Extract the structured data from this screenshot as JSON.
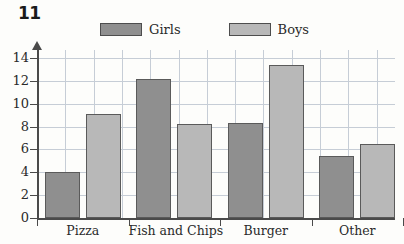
{
  "question_number": "11",
  "legend": {
    "position": "top-center",
    "entries": [
      {
        "label": "Girls",
        "color": "#8f8f8f",
        "swatch_name": "legend-swatch-girls"
      },
      {
        "label": "Boys",
        "color": "#b8b8b8",
        "swatch_name": "legend-swatch-boys"
      }
    ]
  },
  "axes": {
    "y_ticks": [
      "0",
      "2",
      "4",
      "6",
      "8",
      "10",
      "12",
      "14"
    ],
    "y_arrow": true,
    "grid": true
  },
  "chart_data": {
    "type": "bar",
    "title": "11",
    "xlabel": "",
    "ylabel": "",
    "ylim": [
      0,
      14.6
    ],
    "y_ticks": [
      0,
      2,
      4,
      6,
      8,
      10,
      12,
      14
    ],
    "grid": true,
    "legend_position": "top-center",
    "categories": [
      "Pizza",
      "Fish and Chips",
      "Burger",
      "Other"
    ],
    "series": [
      {
        "name": "Girls",
        "color": "#8f8f8f",
        "values": [
          4.0,
          12.2,
          8.3,
          5.4
        ]
      },
      {
        "name": "Boys",
        "color": "#b8b8b8",
        "values": [
          9.1,
          8.2,
          13.4,
          6.5
        ]
      }
    ]
  },
  "colors": {
    "girls": "#8f8f8f",
    "boys": "#b8b8b8",
    "bar_border": "#5a5a5a",
    "axis": "#4a4a4a",
    "grid": "#c6cdd6",
    "background": "#fdfdfb"
  }
}
